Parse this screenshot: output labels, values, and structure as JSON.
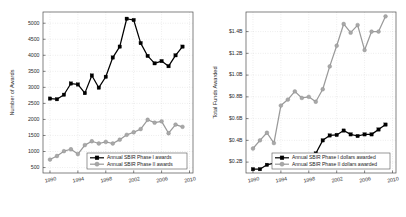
{
  "figure": {
    "background": "#ffffff",
    "width": 406,
    "height": 217,
    "panel_count": 2
  },
  "colors": {
    "phase1": "#000000",
    "phase2": "#a8a8a8",
    "axis": "#4d4d4d",
    "grid": "#c8c8c8",
    "text": "#2b2b2b"
  },
  "chart_data": [
    {
      "id": "awards-chart",
      "type": "line",
      "title": "",
      "xlabel": "",
      "ylabel": "Number of Awards",
      "xlim": [
        1989,
        2010.5
      ],
      "ylim": [
        330,
        5350
      ],
      "xticks": [
        1990,
        1994,
        1998,
        2002,
        2006,
        2010
      ],
      "xticklabels": [
        "1990",
        "1994",
        "1998",
        "2002",
        "2006",
        "2010"
      ],
      "yticks": [
        500,
        1000,
        1500,
        2000,
        2500,
        3000,
        3500,
        4000,
        4500,
        5000
      ],
      "yticklabels": [
        "500",
        "1000",
        "1500",
        "2000",
        "2500",
        "3000",
        "3500",
        "4000",
        "4500",
        "5000"
      ],
      "grid": true,
      "legend_position": "lower-center",
      "x": [
        1990,
        1991,
        1992,
        1993,
        1994,
        1995,
        1996,
        1997,
        1998,
        1999,
        2000,
        2001,
        2002,
        2003,
        2004,
        2005,
        2006,
        2007,
        2008,
        2009
      ],
      "series": [
        {
          "name": "Annual SBIR Phase I awards",
          "marker": "square",
          "color": "#000000",
          "values": [
            2650,
            2630,
            2770,
            3120,
            3090,
            2820,
            3370,
            2990,
            3330,
            3930,
            4270,
            5140,
            5100,
            4380,
            3980,
            3750,
            3820,
            3660,
            4000,
            4270
          ]
        },
        {
          "name": "Annual SBIR Phase II awards",
          "marker": "circle",
          "color": "#a8a8a8",
          "values": [
            750,
            860,
            1010,
            1070,
            920,
            1200,
            1320,
            1250,
            1300,
            1250,
            1370,
            1520,
            1600,
            1700,
            1990,
            1900,
            1940,
            1570,
            1840,
            1770,
            1930
          ]
        }
      ]
    },
    {
      "id": "funds-chart",
      "type": "line",
      "title": "",
      "xlabel": "",
      "ylabel": "Total Funds Awarded",
      "xlim": [
        1989,
        2010.5
      ],
      "ylim": [
        0.1,
        1.58
      ],
      "xticks": [
        1990,
        1994,
        1998,
        2002,
        2006,
        2010
      ],
      "xticklabels": [
        "1990",
        "1994",
        "1998",
        "2002",
        "2006",
        "2010"
      ],
      "yticks": [
        0.2,
        0.4,
        0.6,
        0.8,
        1.0,
        1.2,
        1.4
      ],
      "yticklabels": [
        "$0.2B",
        "$0.4B",
        "$0.6B",
        "$0.8B",
        "$1.0B",
        "$1.2B",
        "$1.4B"
      ],
      "grid": true,
      "legend_position": "lower-center",
      "x": [
        1990,
        1991,
        1992,
        1993,
        1994,
        1995,
        1996,
        1997,
        1998,
        1999,
        2000,
        2001,
        2002,
        2003,
        2004,
        2005,
        2006,
        2007,
        2008,
        2009
      ],
      "series": [
        {
          "name": "Annual SBIR Phase I dollars awarded",
          "marker": "square",
          "color": "#000000",
          "values": [
            0.135,
            0.135,
            0.175,
            0.19,
            0.19,
            0.23,
            0.225,
            0.26,
            0.265,
            0.28,
            0.4,
            0.445,
            0.45,
            0.49,
            0.455,
            0.44,
            0.455,
            0.455,
            0.5,
            0.545
          ]
        },
        {
          "name": "Annual SBIR Phase II dollars awarded",
          "marker": "circle",
          "color": "#a8a8a8",
          "values": [
            0.325,
            0.4,
            0.47,
            0.375,
            0.72,
            0.775,
            0.85,
            0.79,
            0.8,
            0.755,
            0.87,
            1.08,
            1.27,
            1.47,
            1.39,
            1.46,
            1.23,
            1.4,
            1.4,
            1.54
          ]
        }
      ]
    }
  ]
}
